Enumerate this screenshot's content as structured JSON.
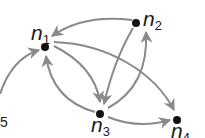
{
  "diagram": {
    "type": "directed-graph",
    "colors": {
      "edge": "#8a8a8a",
      "node": "#111111",
      "label": "#1a1a1a",
      "background": "#ffffff"
    },
    "nodes": [
      {
        "id": "n1",
        "label": "n",
        "subscript": "1",
        "x": 45,
        "y": 47
      },
      {
        "id": "n2",
        "label": "n",
        "subscript": "2",
        "x": 136,
        "y": 23
      },
      {
        "id": "n3",
        "label": "n",
        "subscript": "3",
        "x": 100,
        "y": 114
      },
      {
        "id": "n4",
        "label": "n",
        "subscript": "4",
        "x": 177,
        "y": 120
      }
    ],
    "partial_label": {
      "text": "5"
    },
    "edges": [
      {
        "from": "n5",
        "to": "n1"
      },
      {
        "from": "n2",
        "to": "n1"
      },
      {
        "from": "n1",
        "to": "n3"
      },
      {
        "from": "n3",
        "to": "n1"
      },
      {
        "from": "n2",
        "to": "n3"
      },
      {
        "from": "n3",
        "to": "n2"
      },
      {
        "from": "n1",
        "to": "n4"
      },
      {
        "from": "n3",
        "to": "n4"
      }
    ]
  }
}
